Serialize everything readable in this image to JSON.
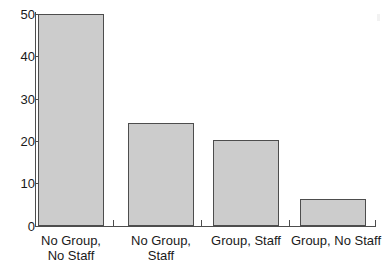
{
  "chart_data": {
    "type": "bar",
    "title": "",
    "subtitle": "",
    "xlabel": "",
    "ylabel": "",
    "categories": [
      "No Group,\nNo Staff",
      "No Group,\nStaff",
      "Group, Staff",
      "Group, No Staff"
    ],
    "values": [
      50,
      24.3,
      20.3,
      6.4
    ],
    "ylim": [
      0,
      50
    ],
    "yticks": [
      0,
      10,
      20,
      30,
      40,
      50
    ],
    "ytick_labels": [
      "0",
      "10",
      "20",
      "30",
      "40",
      "50"
    ],
    "grid": false,
    "legend": null,
    "bar_color": "#cccccc",
    "bar_edge_color": "#4d4d4d",
    "axis_color": "#4d4d4d",
    "background": "#ffffff"
  }
}
